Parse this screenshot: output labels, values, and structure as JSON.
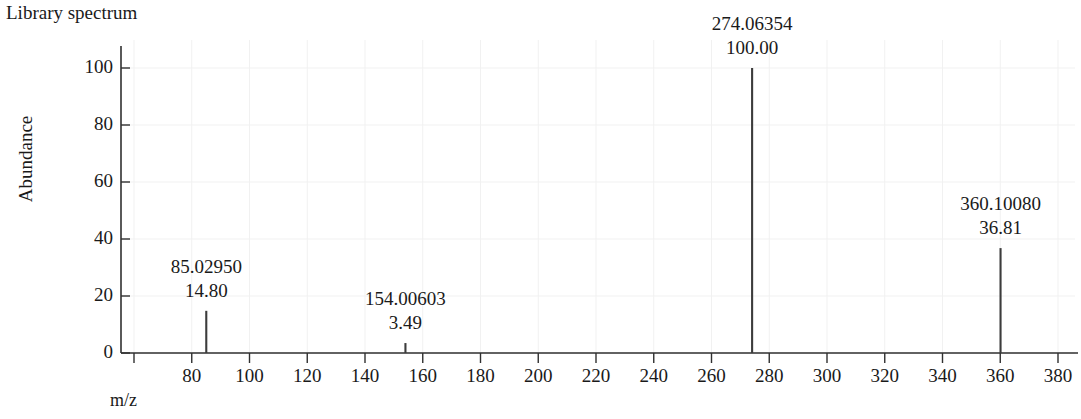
{
  "chart_data": {
    "type": "bar",
    "title": "Library spectrum",
    "xlabel": "m/z",
    "ylabel": "Abundance",
    "xlim": [
      60,
      385
    ],
    "ylim": [
      0,
      108
    ],
    "grid": true,
    "legend": null,
    "x_ticks": [
      60,
      80,
      100,
      120,
      140,
      160,
      180,
      200,
      220,
      240,
      260,
      280,
      300,
      320,
      340,
      360,
      380
    ],
    "x_tick_labels": [
      "",
      "80",
      "100",
      "120",
      "140",
      "160",
      "180",
      "200",
      "220",
      "240",
      "260",
      "280",
      "300",
      "320",
      "340",
      "360",
      "380"
    ],
    "y_ticks": [
      0,
      20,
      40,
      60,
      80,
      100
    ],
    "y_tick_labels": [
      "0",
      "20",
      "40",
      "60",
      "80",
      "100"
    ],
    "x": [
      85.0295,
      154.00603,
      274.06354,
      360.1008
    ],
    "values": [
      14.8,
      36.81,
      100.0,
      36.81
    ],
    "peaks": [
      {
        "mz": 85.0295,
        "mz_label": "85.02950",
        "abundance": 14.8,
        "abundance_label": "14.80"
      },
      {
        "mz": 154.00603,
        "mz_label": "154.00603",
        "abundance": 3.49,
        "abundance_label": "3.49"
      },
      {
        "mz": 274.06354,
        "mz_label": "274.06354",
        "abundance": 100.0,
        "abundance_label": "100.00"
      },
      {
        "mz": 360.1008,
        "mz_label": "360.10080",
        "abundance": 36.81,
        "abundance_label": "36.81"
      }
    ],
    "colors": {
      "axis": "#303030",
      "peak": "#3c3c3c",
      "grid": "#f1f1f1",
      "text": "#1a1a1a",
      "background": "#ffffff"
    }
  }
}
